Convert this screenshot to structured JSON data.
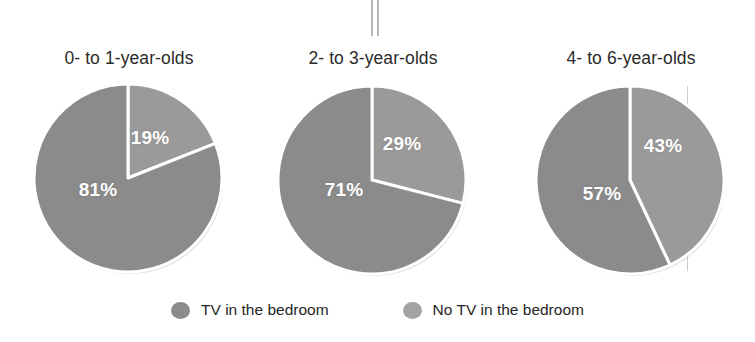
{
  "chart_data": {
    "type": "pie",
    "title": "",
    "subtitle": "",
    "legend_position": "bottom",
    "grid": false,
    "categories": [
      "TV in the bedroom",
      "No TV in the bedroom"
    ],
    "colors": {
      "tv_in_bedroom": "#8b8b8b",
      "no_tv_in_bedroom": "#9a9a9a",
      "divider": "#ffffff",
      "title_text": "#2b2b2b",
      "label_text": "#ffffff"
    },
    "panels": [
      {
        "label": "0- to 1-year-olds",
        "slices": [
          {
            "name": "No TV in the bedroom",
            "value": 19,
            "display": "19%",
            "color": "#9a9a9a",
            "start_angle": 0,
            "end_angle": 68.4
          },
          {
            "name": "TV in the bedroom",
            "value": 81,
            "display": "81%",
            "color": "#8b8b8b",
            "start_angle": 68.4,
            "end_angle": 360
          }
        ]
      },
      {
        "label": "2- to 3-year-olds",
        "slices": [
          {
            "name": "No TV in the bedroom",
            "value": 29,
            "display": "29%",
            "color": "#9a9a9a",
            "start_angle": 0,
            "end_angle": 104.4
          },
          {
            "name": "TV in the bedroom",
            "value": 71,
            "display": "71%",
            "color": "#8b8b8b",
            "start_angle": 104.4,
            "end_angle": 360
          }
        ]
      },
      {
        "label": "4- to 6-year-olds",
        "slices": [
          {
            "name": "No TV in the bedroom",
            "value": 43,
            "display": "43%",
            "color": "#9a9a9a",
            "start_angle": 0,
            "end_angle": 154.8
          },
          {
            "name": "TV in the bedroom",
            "value": 57,
            "display": "57%",
            "color": "#8b8b8b",
            "start_angle": 154.8,
            "end_angle": 360
          }
        ]
      }
    ]
  },
  "panels": [
    {
      "title": "0- to 1-year-olds",
      "labels": [
        {
          "text": "19%",
          "x": 118,
          "y": 56
        },
        {
          "text": "81%",
          "x": 66,
          "y": 108
        }
      ]
    },
    {
      "title": "2- to 3-year-olds",
      "labels": [
        {
          "text": "29%",
          "x": 126,
          "y": 60
        },
        {
          "text": "71%",
          "x": 68,
          "y": 106
        }
      ]
    },
    {
      "title": "4- to 6-year-olds",
      "labels": [
        {
          "text": "43%",
          "x": 129,
          "y": 62
        },
        {
          "text": "57%",
          "x": 68,
          "y": 110
        }
      ]
    }
  ],
  "legend": {
    "items": [
      {
        "label": "TV in the bedroom",
        "color": "#8b8b8b"
      },
      {
        "label": "No TV in the bedroom",
        "color": "#a3a3a3"
      }
    ]
  }
}
